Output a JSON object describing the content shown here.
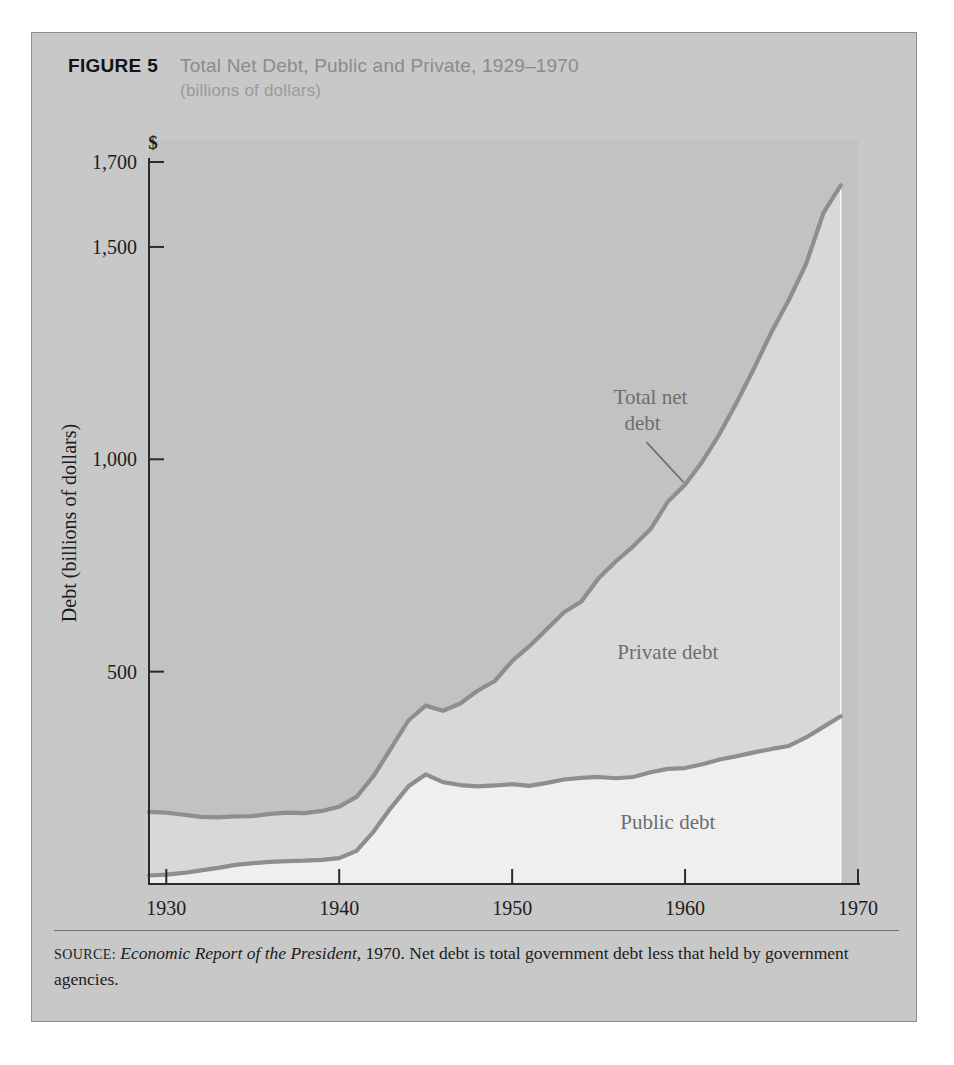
{
  "figure": {
    "label": "FIGURE 5",
    "title": "Total Net Debt, Public and Private, 1929–1970",
    "subtitle": "(billions of dollars)"
  },
  "source": {
    "kicker": "SOURCE:",
    "italic_part": "Economic Report of the President,",
    "rest": " 1970. Net debt is total government debt less that held by government agencies."
  },
  "colors": {
    "panel_background": "#c8c8c8",
    "plot_background": "#c2c2c2",
    "private_band": "#d8d8d8",
    "public_band": "#efefef",
    "curve_line": "#8e8e8e",
    "axis_line": "#2b2b2b",
    "title_gray": "#8b8b8b",
    "annotation_gray": "#6e6e6e"
  },
  "chart_data": {
    "type": "area",
    "title": "Total Net Debt, Public and Private, 1929–1970",
    "subtitle": "(billions of dollars)",
    "xlabel": "",
    "ylabel": "Debt (billions of dollars)",
    "currency_symbol": "$",
    "xlim": [
      1929,
      1970
    ],
    "ylim": [
      0,
      1700
    ],
    "xticks": [
      1930,
      1940,
      1950,
      1960,
      1970
    ],
    "xticklabels": [
      "1930",
      "1940",
      "1950",
      "1960",
      "1970"
    ],
    "yticks": [
      500,
      1000,
      1500,
      1700
    ],
    "yticklabels": [
      "500",
      "1,000",
      "1,500",
      "1,700"
    ],
    "grid": false,
    "legend": "in-plot annotations",
    "annotations": [
      {
        "text": "Total net",
        "line2": "debt",
        "x": 1958,
        "y": 1130
      },
      {
        "text": "Private debt",
        "x": 1959,
        "y": 530
      },
      {
        "text": "Public debt",
        "x": 1959,
        "y": 130
      }
    ],
    "x": [
      1929,
      1930,
      1931,
      1932,
      1933,
      1934,
      1935,
      1936,
      1937,
      1938,
      1939,
      1940,
      1941,
      1942,
      1943,
      1944,
      1945,
      1946,
      1947,
      1948,
      1949,
      1950,
      1951,
      1952,
      1953,
      1954,
      1955,
      1956,
      1957,
      1958,
      1959,
      1960,
      1961,
      1962,
      1963,
      1964,
      1965,
      1966,
      1967,
      1968,
      1969
    ],
    "series": [
      {
        "name": "Public debt",
        "values": [
          20,
          22,
          26,
          32,
          38,
          45,
          49,
          52,
          54,
          55,
          57,
          61,
          78,
          124,
          180,
          230,
          258,
          240,
          233,
          230,
          232,
          235,
          231,
          238,
          246,
          250,
          252,
          249,
          252,
          263,
          271,
          273,
          282,
          293,
          301,
          310,
          318,
          325,
          345,
          370,
          395
        ],
        "band_color": "#efefef",
        "line_color": "#8e8e8e"
      },
      {
        "name": "Total net debt",
        "values": [
          170,
          168,
          163,
          158,
          157,
          159,
          160,
          165,
          168,
          167,
          172,
          182,
          205,
          255,
          320,
          385,
          420,
          408,
          425,
          455,
          478,
          525,
          560,
          600,
          640,
          665,
          720,
          760,
          795,
          835,
          900,
          940,
          995,
          1060,
          1135,
          1215,
          1300,
          1375,
          1460,
          1580,
          1645
        ],
        "band_color": "#d8d8d8",
        "line_color": "#8e8e8e"
      }
    ],
    "note": "Private debt is the band between the public debt curve and the total net debt curve."
  }
}
